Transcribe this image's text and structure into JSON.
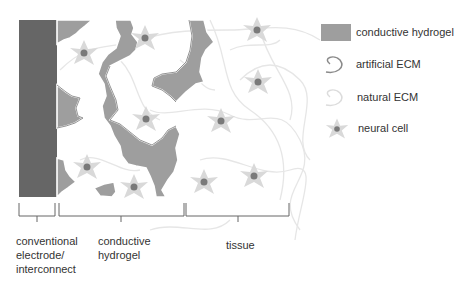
{
  "colors": {
    "electrode": "#666666",
    "hydrogel": "#9e9e9e",
    "hydrogel_outline": "#7a7a7a",
    "artificial_ecm": "#8a8a8a",
    "natural_ecm": "#e0e0e0",
    "cell_body": "#d9d9d9",
    "cell_nucleus": "#7a7a7a",
    "bracket": "#666666",
    "text": "#333333"
  },
  "legend": {
    "items": [
      {
        "label": "conductive hydrogel",
        "icon": "hydrogel-swatch"
      },
      {
        "label": "artificial ECM",
        "icon": "artificial-ecm-curl"
      },
      {
        "label": "natural ECM",
        "icon": "natural-ecm-curl"
      },
      {
        "label": "neural cell",
        "icon": "neural-cell-star"
      }
    ]
  },
  "regions": [
    {
      "label_lines": [
        "conventional",
        "electrode/",
        "interconnect"
      ]
    },
    {
      "label_lines": [
        "conductive",
        "hydrogel"
      ]
    },
    {
      "label_lines": [
        "tissue"
      ]
    }
  ]
}
